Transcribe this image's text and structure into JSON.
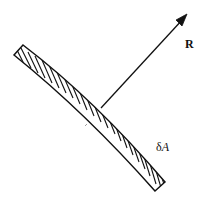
{
  "diagram": {
    "elements": [
      {
        "id": "surface-element",
        "type": "curved-hatched-strip",
        "description": "Small curved surface element with diagonal hatching",
        "corners": [
          [
            14,
            55
          ],
          [
            23,
            45
          ],
          [
            165,
            182
          ],
          [
            155,
            191
          ]
        ]
      },
      {
        "id": "normal-vector",
        "type": "arrow",
        "from": [
          101,
          108
        ],
        "to": [
          187,
          14
        ],
        "label": "R"
      }
    ],
    "labels": {
      "vector": "R",
      "area_prefix": "δ",
      "area_symbol": "A"
    },
    "colors": {
      "stroke": "#111111",
      "background": "#ffffff"
    }
  }
}
